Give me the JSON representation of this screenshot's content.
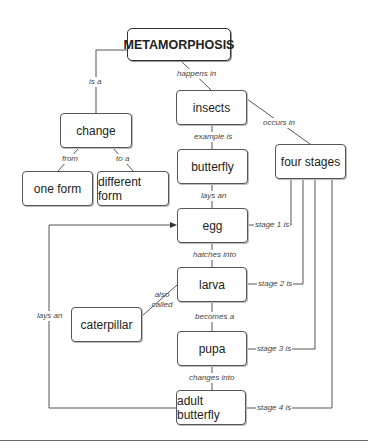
{
  "diagram": {
    "type": "concept-map",
    "root": "METAMORPHOSIS",
    "nodes": {
      "metamorphosis": "METAMORPHOSIS",
      "change": "change",
      "one_form": "one form",
      "different_form": "different form",
      "insects": "insects",
      "butterfly": "butterfly",
      "four_stages": "four stages",
      "egg": "egg",
      "larva": "larva",
      "caterpillar": "caterpillar",
      "pupa": "pupa",
      "adult_butterfly": "adult butterfly"
    },
    "links": {
      "is_a": "is a",
      "happens_in": "happens in",
      "from": "from",
      "to_a": "to a",
      "example_is": "example is",
      "occurs_in": "occurs in",
      "lays_an_1": "lays an",
      "hatches_into": "hatches into",
      "also_called": "also called",
      "becomes_a": "becomes a",
      "changes_into": "changes into",
      "lays_an_2": "lays an",
      "stage_1": "stage 1 is",
      "stage_2": "stage 2 is",
      "stage_3": "stage 3 is",
      "stage_4": "stage 4 is"
    },
    "edges": [
      {
        "from": "METAMORPHOSIS",
        "label": "is a",
        "to": "change"
      },
      {
        "from": "METAMORPHOSIS",
        "label": "happens in",
        "to": "insects"
      },
      {
        "from": "change",
        "label": "from",
        "to": "one form"
      },
      {
        "from": "change",
        "label": "to a",
        "to": "different form"
      },
      {
        "from": "insects",
        "label": "example is",
        "to": "butterfly"
      },
      {
        "from": "insects",
        "label": "occurs in",
        "to": "four stages"
      },
      {
        "from": "butterfly",
        "label": "lays an",
        "to": "egg"
      },
      {
        "from": "egg",
        "label": "hatches into",
        "to": "larva"
      },
      {
        "from": "larva",
        "label": "also called",
        "to": "caterpillar"
      },
      {
        "from": "larva",
        "label": "becomes a",
        "to": "pupa"
      },
      {
        "from": "pupa",
        "label": "changes into",
        "to": "adult butterfly"
      },
      {
        "from": "adult butterfly",
        "label": "lays an",
        "to": "egg"
      },
      {
        "from": "four stages",
        "label": "stage 1 is",
        "to": "egg"
      },
      {
        "from": "four stages",
        "label": "stage 2 is",
        "to": "larva"
      },
      {
        "from": "four stages",
        "label": "stage 3 is",
        "to": "pupa"
      },
      {
        "from": "four stages",
        "label": "stage 4 is",
        "to": "adult butterfly"
      }
    ]
  }
}
